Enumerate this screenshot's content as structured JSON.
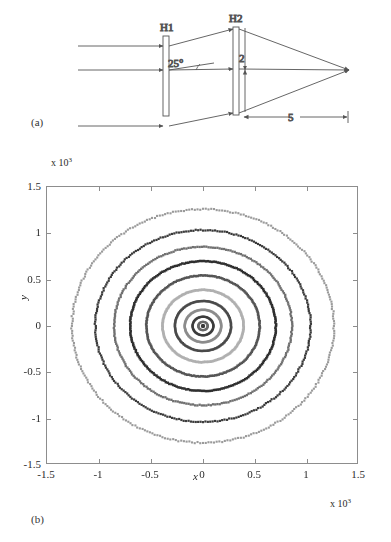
{
  "figure": {
    "panel_a_label": "(a)",
    "panel_b_label": "(b)"
  },
  "diagram": {
    "title_h1": "H1",
    "title_h2": "H2",
    "angle_label": "25°",
    "gap_label": "2",
    "distance_label": "5",
    "stroke_color": "#555555",
    "bar_fill": "#ffffff",
    "n_input_rays": 3
  },
  "chart_data": {
    "type": "scatter",
    "title": "",
    "xlabel": "x",
    "ylabel": "y",
    "x_exponent_label": "x 10³",
    "y_exponent_label": "x 10³",
    "xlim": [
      -1.5,
      1.5
    ],
    "ylim": [
      -1.5,
      1.5
    ],
    "xticks": [
      -1.5,
      -1,
      -0.5,
      0,
      0.5,
      1,
      1.5
    ],
    "xticklabels": [
      "-1.5",
      "-1",
      "-0.5",
      "0",
      "0.5",
      "1",
      "1.5"
    ],
    "yticks": [
      -1.5,
      -1,
      -0.5,
      0,
      0.5,
      1,
      1.5
    ],
    "yticklabels": [
      "-1.5",
      "-1",
      "-0.5",
      "0",
      "0.5",
      "1",
      "1.5"
    ],
    "grid": false,
    "legend": null,
    "marker": "square-dot",
    "series": [
      {
        "name": "ring-0",
        "radius": 0.0,
        "color": "#3a3a3a",
        "marker_size": 2.2,
        "n_points": 1
      },
      {
        "name": "ring-1",
        "radius": 0.045,
        "color": "#6a6a6a",
        "marker_size": 2.0,
        "n_points": 60
      },
      {
        "name": "ring-2",
        "radius": 0.1,
        "color": "#3d3d3d",
        "marker_size": 2.2,
        "n_points": 80
      },
      {
        "name": "ring-3",
        "radius": 0.175,
        "color": "#8c8c8c",
        "marker_size": 2.4,
        "n_points": 110
      },
      {
        "name": "ring-4",
        "radius": 0.27,
        "color": "#4a4a4a",
        "marker_size": 2.4,
        "n_points": 140
      },
      {
        "name": "ring-5",
        "radius": 0.39,
        "color": "#b0b0b0",
        "marker_size": 2.6,
        "n_points": 170
      },
      {
        "name": "ring-6",
        "radius": 0.545,
        "color": "#555555",
        "marker_size": 2.5,
        "n_points": 200
      },
      {
        "name": "ring-7",
        "radius": 0.7,
        "color": "#2f2f2f",
        "marker_size": 2.5,
        "n_points": 230
      },
      {
        "name": "ring-8",
        "radius": 0.855,
        "color": "#707070",
        "marker_size": 2.3,
        "n_points": 250
      },
      {
        "name": "ring-9",
        "radius": 1.035,
        "color": "#3a3a3a",
        "marker_size": 2.2,
        "n_points": 280
      },
      {
        "name": "ring-10",
        "radius": 1.26,
        "color": "#9a9a9a",
        "marker_size": 2.1,
        "n_points": 300
      }
    ]
  }
}
